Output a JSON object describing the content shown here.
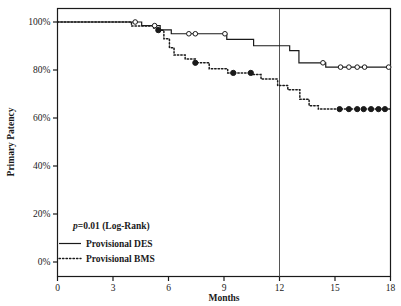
{
  "chart_data": {
    "type": "line",
    "title": "",
    "xlabel": "Months",
    "ylabel": "Primary Patency",
    "xlim": [
      0,
      18
    ],
    "ylim": [
      0,
      1.0
    ],
    "xticks": [
      0,
      3,
      6,
      9,
      12,
      15,
      18
    ],
    "xticklabels": [
      "0",
      "3",
      "6",
      "9",
      "12",
      "15",
      "18"
    ],
    "yticks": [
      0,
      0.2,
      0.4,
      0.6,
      0.8,
      1.0
    ],
    "yticklabels": [
      "0%",
      "20%",
      "40%",
      "60%",
      "80%",
      "100%"
    ],
    "grid": false,
    "legend_position": "lower-left",
    "annotations": [
      {
        "name": "p-value",
        "text_italic": "p",
        "text": "=0.01 (Log-Rank)",
        "x": 1.1,
        "y": 0.175
      }
    ],
    "reference_lines": [
      {
        "name": "12-month-reference",
        "orientation": "vertical",
        "x": 12,
        "color": "#555555"
      }
    ],
    "series": [
      {
        "name": "Provisional DES",
        "style": "solid",
        "color": "#1a1a1a",
        "marker": "open-circle",
        "step_points": [
          [
            0.0,
            1.0
          ],
          [
            4.55,
            1.0
          ],
          [
            4.55,
            0.985
          ],
          [
            5.55,
            0.985
          ],
          [
            5.55,
            0.967
          ],
          [
            6.15,
            0.967
          ],
          [
            6.15,
            0.951
          ],
          [
            9.15,
            0.951
          ],
          [
            9.15,
            0.928
          ],
          [
            10.6,
            0.928
          ],
          [
            10.6,
            0.901
          ],
          [
            12.55,
            0.901
          ],
          [
            12.55,
            0.881
          ],
          [
            13.05,
            0.881
          ],
          [
            13.05,
            0.83
          ],
          [
            14.5,
            0.83
          ],
          [
            14.5,
            0.812
          ],
          [
            18.0,
            0.812
          ]
        ],
        "censor_marks": [
          [
            4.2,
            1.0
          ],
          [
            5.25,
            0.985
          ],
          [
            7.1,
            0.951
          ],
          [
            7.45,
            0.951
          ],
          [
            9.05,
            0.951
          ],
          [
            14.35,
            0.83
          ],
          [
            15.3,
            0.812
          ],
          [
            15.75,
            0.812
          ],
          [
            16.2,
            0.812
          ],
          [
            16.6,
            0.812
          ],
          [
            17.9,
            0.812
          ]
        ],
        "final_value": 0.812
      },
      {
        "name": "Provisional BMS",
        "style": "dotted",
        "color": "#1a1a1a",
        "marker": "filled-circle",
        "step_points": [
          [
            0.0,
            1.0
          ],
          [
            4.0,
            1.0
          ],
          [
            4.0,
            0.983
          ],
          [
            5.2,
            0.983
          ],
          [
            5.2,
            0.975
          ],
          [
            5.45,
            0.975
          ],
          [
            5.45,
            0.966
          ],
          [
            5.75,
            0.966
          ],
          [
            5.75,
            0.93
          ],
          [
            6.05,
            0.93
          ],
          [
            6.05,
            0.893
          ],
          [
            6.3,
            0.893
          ],
          [
            6.3,
            0.862
          ],
          [
            6.9,
            0.862
          ],
          [
            6.9,
            0.846
          ],
          [
            7.45,
            0.846
          ],
          [
            7.45,
            0.83
          ],
          [
            8.2,
            0.83
          ],
          [
            8.2,
            0.805
          ],
          [
            9.2,
            0.805
          ],
          [
            9.2,
            0.788
          ],
          [
            10.5,
            0.788
          ],
          [
            10.5,
            0.781
          ],
          [
            11.0,
            0.781
          ],
          [
            11.0,
            0.762
          ],
          [
            11.9,
            0.762
          ],
          [
            11.9,
            0.735
          ],
          [
            12.45,
            0.735
          ],
          [
            12.45,
            0.718
          ],
          [
            13.1,
            0.718
          ],
          [
            13.1,
            0.678
          ],
          [
            13.6,
            0.678
          ],
          [
            13.6,
            0.651
          ],
          [
            14.1,
            0.651
          ],
          [
            14.1,
            0.637
          ],
          [
            18.0,
            0.637
          ]
        ],
        "censor_marks": [
          [
            5.45,
            0.966
          ],
          [
            7.45,
            0.83
          ],
          [
            9.5,
            0.788
          ],
          [
            10.45,
            0.788
          ],
          [
            15.25,
            0.637
          ],
          [
            15.75,
            0.637
          ],
          [
            16.2,
            0.637
          ],
          [
            16.55,
            0.637
          ],
          [
            16.95,
            0.637
          ],
          [
            17.35,
            0.637
          ],
          [
            17.7,
            0.637
          ]
        ],
        "final_value": 0.637
      }
    ]
  },
  "axes": {
    "xlabel": "Months",
    "ylabel": "Primary Patency"
  },
  "legend": {
    "pvalue_italic": "p",
    "pvalue_text": "=0.01 (Log-Rank)",
    "entries": [
      {
        "label": "Provisional DES",
        "style": "solid"
      },
      {
        "label": "Provisional BMS",
        "style": "dotted"
      }
    ]
  }
}
